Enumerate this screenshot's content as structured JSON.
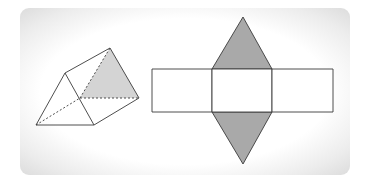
{
  "figure": {
    "colors": {
      "stroke": "#3a3a3a",
      "prism_shade": "#d4d4d4",
      "net_shade": "#a9a9a9",
      "background": "#ffffff"
    },
    "prism": {
      "front_triangle": [
        [
          36,
          125
        ],
        [
          65,
          73
        ],
        [
          94,
          125
        ]
      ],
      "back_triangle": [
        [
          80,
          98
        ],
        [
          110,
          48
        ],
        [
          139,
          98
        ]
      ],
      "shaded_face": "back triangle",
      "hidden_edges": [
        "back bottom-left to back top",
        "back bottom-left to back bottom-right",
        "front bottom-left to back bottom-left"
      ]
    },
    "net": {
      "rectangles": [
        {
          "x": 152,
          "y": 69,
          "w": 60,
          "h": 43
        },
        {
          "x": 212,
          "y": 69,
          "w": 60,
          "h": 43
        },
        {
          "x": 272,
          "y": 69,
          "w": 61,
          "h": 43
        }
      ],
      "top_triangle": [
        [
          212,
          69
        ],
        [
          243,
          17
        ],
        [
          272,
          69
        ]
      ],
      "bottom_triangle": [
        [
          212,
          112
        ],
        [
          243,
          164
        ],
        [
          272,
          112
        ]
      ]
    }
  }
}
